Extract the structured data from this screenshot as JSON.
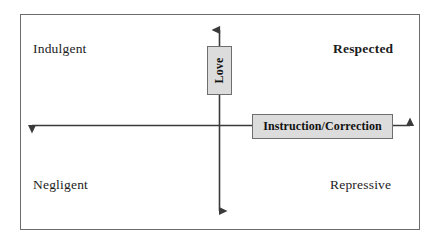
{
  "diagram": {
    "background_color": "#ffffff",
    "frame": {
      "border_color": "#6b6b6b"
    },
    "axes": {
      "vertical": {
        "label": "Love",
        "orientation": "vertical",
        "arrow_style": "double-headed",
        "color": "#3a3a3a"
      },
      "horizontal": {
        "label": "Instruction/Correction",
        "orientation": "horizontal",
        "arrow_style": "double-headed",
        "color": "#3a3a3a"
      },
      "box_fill_color": "#dcdcdc",
      "box_border_color": "#6e6e6e"
    },
    "quadrants": [
      {
        "id": "top-left",
        "label": "Indulgent",
        "emphasis": "normal"
      },
      {
        "id": "top-right",
        "label": "Respected",
        "emphasis": "bold"
      },
      {
        "id": "bottom-left",
        "label": "Negligent",
        "emphasis": "normal"
      },
      {
        "id": "bottom-right",
        "label": "Repressive",
        "emphasis": "normal"
      }
    ]
  }
}
